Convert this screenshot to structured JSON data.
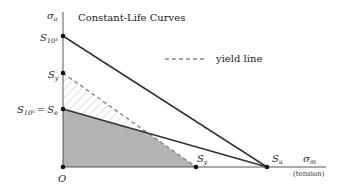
{
  "diagram": {
    "title": "Constant-Life Curves",
    "y_axis": {
      "symbol": "σ",
      "subscript": "a"
    },
    "x_axis": {
      "symbol": "σ",
      "subscript": "m",
      "note": "(tension)"
    },
    "origin_label": "O",
    "y_points": [
      {
        "id": "S_10^3",
        "base": "S",
        "sub": "10³"
      },
      {
        "id": "S_y",
        "base": "S",
        "sub": "y"
      },
      {
        "id": "S_10^6 = S_e",
        "base": "S",
        "sub": "10⁶",
        "eq": "=",
        "base2": "S",
        "sub2": "e"
      }
    ],
    "x_points": [
      {
        "id": "S_y",
        "base": "S",
        "sub": "y"
      },
      {
        "id": "S_u",
        "base": "S",
        "sub": "u"
      }
    ],
    "legend": {
      "label": "yield line",
      "style": "dashed"
    },
    "colors": {
      "line": "#333333",
      "fill_gray": "#b3b3b3",
      "hatch": "#bdbdbd",
      "dash": "#888888"
    }
  }
}
